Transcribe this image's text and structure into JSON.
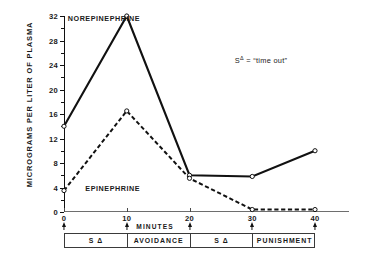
{
  "chart_data": {
    "type": "line",
    "title": "",
    "xlabel": "MINUTES",
    "ylabel": "MICROGRAMS PER LITER OF PLASMA",
    "x": [
      0,
      10,
      20,
      30,
      40
    ],
    "xlim": [
      0,
      40
    ],
    "ylim": [
      0,
      32
    ],
    "xticks": [
      "0",
      "10",
      "20",
      "30",
      "40"
    ],
    "yticks": [
      "0",
      "4",
      "8",
      "12",
      "16",
      "20",
      "24",
      "28",
      "32"
    ],
    "ytick_step": 4,
    "yminor_step": 2,
    "grid": false,
    "legend_position": "inline-labels",
    "series": [
      {
        "name": "NOREPINEPHRINE",
        "style": "solid",
        "marker": "open-circle",
        "values": [
          14,
          32,
          6,
          5.8,
          10
        ]
      },
      {
        "name": "EPINEPHRINE",
        "style": "dashed",
        "marker": "open-circle",
        "values": [
          3.5,
          16.5,
          5.5,
          0.4,
          0.4
        ]
      }
    ],
    "annotations": [
      {
        "text_prefix": "S",
        "text_sup": "Δ",
        "text_suffix": " = “time out”"
      }
    ],
    "phases": [
      {
        "label": "S Δ",
        "start": 0,
        "end": 10
      },
      {
        "label": "AVOIDANCE",
        "start": 10,
        "end": 20
      },
      {
        "label": "S Δ",
        "start": 20,
        "end": 30
      },
      {
        "label": "PUNISHMENT",
        "start": 30,
        "end": 40
      }
    ]
  },
  "labels": {
    "series_norepinephrine": "NOREPINEPHRINE",
    "series_epinephrine": "EPINEPHRINE",
    "y_axis_title": "MICROGRAMS PER LITER OF PLASMA",
    "x_axis_title": "MINUTES",
    "annotation_prefix": "S",
    "annotation_sup": "Δ",
    "annotation_suffix": " = “time out”",
    "ytick_0": "0",
    "ytick_4": "4",
    "ytick_8": "8",
    "ytick_12": "12",
    "ytick_16": "16",
    "ytick_20": "20",
    "ytick_24": "24",
    "ytick_28": "28",
    "ytick_32": "32",
    "xtick_0": "0",
    "xtick_10": "10",
    "xtick_20": "20",
    "xtick_30": "30",
    "xtick_40": "40",
    "phase_1": "S Δ",
    "phase_2": "AVOIDANCE",
    "phase_3": "S Δ",
    "phase_4": "PUNISHMENT"
  }
}
